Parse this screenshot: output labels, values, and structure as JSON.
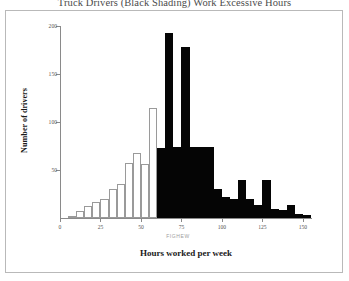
{
  "figure": {
    "title": "Truck Drivers (Black Shading) Work Excessive Hours",
    "artifact_text": "FIGHEW",
    "frame_color": "#b9b9b9"
  },
  "axes": {
    "x_title": "Hours worked per week",
    "y_title": "Number of drivers",
    "x_ticks": [
      "0",
      "25",
      "50",
      "75",
      "100",
      "125",
      "150"
    ],
    "y_ticks": [
      "200",
      "150",
      "100",
      "50",
      "0"
    ]
  },
  "chart_data": {
    "type": "bar",
    "title": "Truck Drivers (Black Shading) Work Excessive Hours",
    "xlabel": "Hours worked per week",
    "ylabel": "Number of drivers",
    "xlim": [
      0,
      155
    ],
    "ylim": [
      0,
      200
    ],
    "grid": false,
    "legend": "none",
    "bin_width": 5,
    "legend_note": "Black shading marks drivers working excessive hours (above 60 hours/week)",
    "series": [
      {
        "name": "Legal hours (white shading)",
        "color": "#ffffff",
        "edge_color": "#9a9a9a",
        "bins": [
          {
            "x0": 5,
            "x1": 10,
            "value": 2
          },
          {
            "x0": 10,
            "x1": 15,
            "value": 7
          },
          {
            "x0": 15,
            "x1": 20,
            "value": 13
          },
          {
            "x0": 20,
            "x1": 25,
            "value": 17
          },
          {
            "x0": 25,
            "x1": 30,
            "value": 20
          },
          {
            "x0": 30,
            "x1": 35,
            "value": 30
          },
          {
            "x0": 35,
            "x1": 40,
            "value": 35
          },
          {
            "x0": 40,
            "x1": 45,
            "value": 57
          },
          {
            "x0": 45,
            "x1": 50,
            "value": 68
          },
          {
            "x0": 50,
            "x1": 55,
            "value": 56
          },
          {
            "x0": 55,
            "x1": 60,
            "value": 115
          }
        ]
      },
      {
        "name": "Excessive hours (black shading)",
        "color": "#050505",
        "bins": [
          {
            "x0": 60,
            "x1": 65,
            "value": 73
          },
          {
            "x0": 65,
            "x1": 70,
            "value": 193
          },
          {
            "x0": 70,
            "x1": 75,
            "value": 74
          },
          {
            "x0": 75,
            "x1": 80,
            "value": 178
          },
          {
            "x0": 80,
            "x1": 85,
            "value": 74
          },
          {
            "x0": 85,
            "x1": 90,
            "value": 74
          },
          {
            "x0": 90,
            "x1": 95,
            "value": 74
          },
          {
            "x0": 95,
            "x1": 100,
            "value": 30
          },
          {
            "x0": 100,
            "x1": 105,
            "value": 22
          },
          {
            "x0": 105,
            "x1": 110,
            "value": 20
          },
          {
            "x0": 110,
            "x1": 115,
            "value": 40
          },
          {
            "x0": 115,
            "x1": 120,
            "value": 20
          },
          {
            "x0": 120,
            "x1": 125,
            "value": 14
          },
          {
            "x0": 125,
            "x1": 130,
            "value": 40
          },
          {
            "x0": 130,
            "x1": 135,
            "value": 9
          },
          {
            "x0": 135,
            "x1": 140,
            "value": 8
          },
          {
            "x0": 140,
            "x1": 145,
            "value": 14
          },
          {
            "x0": 145,
            "x1": 150,
            "value": 4
          },
          {
            "x0": 150,
            "x1": 155,
            "value": 3
          }
        ]
      }
    ]
  }
}
